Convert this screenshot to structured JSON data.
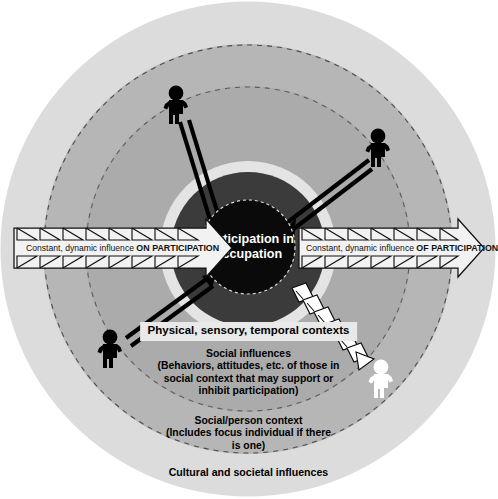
{
  "diagram": {
    "center": {
      "label": "Participation in\noccupation",
      "fill": "#0a0a0a",
      "text_color": "#ffffff",
      "border_style": "dashed"
    },
    "rings": [
      {
        "name": "cultural-societal-ring",
        "label": "Cultural and societal influences",
        "fill": "#dcdcdc",
        "radius": 248
      },
      {
        "name": "social-person-ring",
        "label": "Social/person context\n(Includes focus individual if there\nis one)",
        "fill": "#b6b6b6",
        "radius": 205
      },
      {
        "name": "social-influences-ring",
        "label": "Social influences\n(Behaviors, attitudes, etc. of those in\nsocial context that may support or\ninhibit participation)",
        "fill": "#ababab",
        "radius": 163
      },
      {
        "name": "physical-sensory-ring",
        "label": "Physical, sensory, temporal contexts",
        "fill": "#e4e4e4",
        "radius": 88
      },
      {
        "name": "inner-dark-ring",
        "label": "",
        "fill": "#3b3b3b",
        "radius": 77
      }
    ],
    "labels": {
      "physical": "Physical, sensory, temporal contexts",
      "social_influences": "Social influences\n(Behaviors, attitudes, etc. of those in\nsocial context that may support or\ninhibit participation)",
      "social_person": "Social/person context\n(Includes focus individual if there\nis one)",
      "cultural": "Cultural and societal influences"
    },
    "banners": [
      {
        "name": "banner-on-participation",
        "text_plain": "Constant, dynamic influence ",
        "text_emphasis": "ON PARTICIPATION",
        "direction": "right",
        "fill": "#f2f2f2",
        "stroke": "#111111"
      },
      {
        "name": "banner-of-participation",
        "text_plain": "Constant, dynamic influence ",
        "text_emphasis": "OF PARTICIPATION",
        "direction": "right",
        "fill": "#f2f2f2",
        "stroke": "#111111"
      }
    ],
    "figures": [
      {
        "name": "figure-top-left",
        "color": "#000000",
        "x": 176,
        "y": 104
      },
      {
        "name": "figure-top-right",
        "color": "#000000",
        "x": 378,
        "y": 147
      },
      {
        "name": "figure-bottom-left",
        "color": "#000000",
        "x": 110,
        "y": 348
      },
      {
        "name": "figure-bottom-right",
        "color": "#ffffff",
        "x": 381,
        "y": 378
      }
    ],
    "connector_arrows": [
      {
        "name": "arrow-top-left-to-center",
        "style": "double-line",
        "color": "#000000"
      },
      {
        "name": "arrow-top-right-to-center",
        "style": "double-line",
        "color": "#000000"
      },
      {
        "name": "arrow-bottom-left-to-center",
        "style": "double-line",
        "color": "#000000"
      },
      {
        "name": "arrow-bottom-right-chevron",
        "style": "chevron-outline",
        "color": "#ffffff"
      }
    ],
    "colors": {
      "background": "#ffffff",
      "ring_outer": "#dcdcdc",
      "ring_second": "#b6b6b6",
      "ring_third": "#ababab",
      "ring_light_band": "#e4e4e4",
      "ring_dark": "#3b3b3b",
      "center": "#0a0a0a",
      "label_background": "#e9e9e9"
    }
  }
}
